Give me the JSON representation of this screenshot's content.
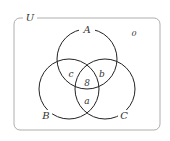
{
  "diagram": {
    "type": "venn",
    "universe_label": "U",
    "sets": [
      {
        "label": "A"
      },
      {
        "label": "B"
      },
      {
        "label": "C"
      }
    ],
    "regions": {
      "outside": "0",
      "A_and_B_only": "c",
      "A_and_C_only": "b",
      "A_and_B_and_C": "8",
      "B_and_C_only": "a"
    },
    "colors": {
      "stroke": "#333333",
      "border": "#999999"
    }
  }
}
